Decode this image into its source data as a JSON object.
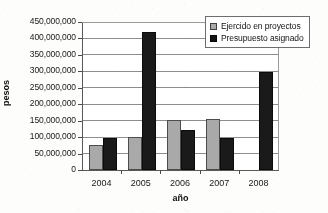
{
  "chart_data": {
    "type": "bar",
    "title": "",
    "xlabel": "año",
    "ylabel": "pesos",
    "categories": [
      "2004",
      "2005",
      "2006",
      "2007",
      "2008"
    ],
    "series": [
      {
        "name": "Ejercido en proyectos",
        "color": "#a8a8a8",
        "values": [
          75000000,
          100000000,
          152000000,
          155000000,
          null
        ]
      },
      {
        "name": "Presupuesto asignado",
        "color": "#1c1c1c",
        "values": [
          98000000,
          420000000,
          123000000,
          97000000,
          297000000
        ]
      }
    ],
    "ylim": [
      0,
      450000000
    ],
    "ytick_values": [
      0,
      50000000,
      100000000,
      150000000,
      200000000,
      250000000,
      300000000,
      350000000,
      400000000,
      450000000
    ],
    "ytick_labels": [
      "0",
      "50,000,000",
      "100,000,000",
      "150,000,000",
      "200,000,000",
      "250,000,000",
      "300,000,000",
      "350,000,000",
      "400,000,000",
      "450,000,000"
    ],
    "grid": true,
    "legend_position": "top-right"
  }
}
